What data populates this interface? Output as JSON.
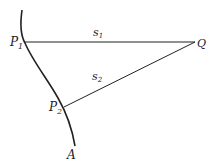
{
  "diagram": {
    "curve_label": "A",
    "points": {
      "p1": {
        "label": "P",
        "subscript": "1"
      },
      "p2": {
        "label": "P",
        "subscript": "2"
      },
      "q": {
        "label": "Q"
      }
    },
    "segments": {
      "s1": {
        "label": "s",
        "subscript": "1",
        "from": "P1",
        "to": "Q"
      },
      "s2": {
        "label": "s",
        "subscript": "2",
        "from": "P2",
        "to": "Q"
      }
    },
    "colors": {
      "stroke": "#222222",
      "background": "#ffffff"
    }
  }
}
